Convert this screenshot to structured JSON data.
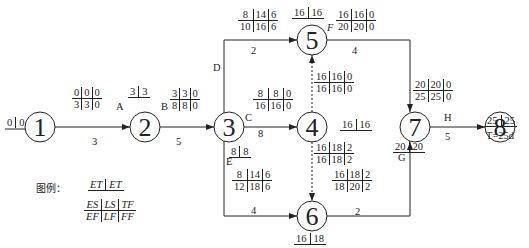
{
  "diagram": {
    "type": "double-code network diagram (activity on arrow)",
    "total_duration": "T=25d",
    "nodes": [
      {
        "id": "1",
        "et": [
          "0",
          "0"
        ],
        "cx": 40,
        "cy": 127
      },
      {
        "id": "2",
        "et": [
          "3",
          "3"
        ],
        "cx": 145,
        "cy": 127
      },
      {
        "id": "3",
        "et": [
          "3",
          "3"
        ],
        "cx": 229,
        "cy": 127
      },
      {
        "id": "4",
        "et": [
          "16",
          "16"
        ],
        "cx": 312,
        "cy": 127
      },
      {
        "id": "5",
        "et": [
          "16",
          "16"
        ],
        "cx": 312,
        "cy": 40
      },
      {
        "id": "6",
        "et": [
          "16",
          "18"
        ],
        "cx": 312,
        "cy": 216
      },
      {
        "id": "7",
        "et": [
          "20",
          "20"
        ],
        "cx": 415,
        "cy": 127
      },
      {
        "id": "8",
        "et": [
          "25",
          "25"
        ],
        "cx": 500,
        "cy": 127
      }
    ],
    "node_et_labels": {
      "n1": "0|0",
      "n2": "3|3",
      "n3": "8|8",
      "n4": "16|16",
      "n5": "16|16",
      "n6": "16|18",
      "n7": "20|20",
      "n8": "25|25"
    },
    "activities": [
      {
        "name": "A",
        "from": "1",
        "to": "2",
        "duration": "3",
        "ES": "0",
        "LS": "0",
        "TF": "0",
        "EF": "3",
        "LF": "3",
        "FF": "0"
      },
      {
        "name": "B",
        "from": "2",
        "to": "3",
        "duration": "5",
        "ES": "3",
        "LS": "3",
        "TF": "0",
        "EF": "8",
        "LF": "8",
        "FF": "0"
      },
      {
        "name": "C",
        "from": "3",
        "to": "4",
        "duration": "8",
        "ES": "8",
        "LS": "8",
        "TF": "0",
        "EF": "16",
        "LF": "16",
        "FF": "0"
      },
      {
        "name": "D",
        "from": "3",
        "to": "5",
        "duration": "2",
        "ES": "8",
        "LS": "14",
        "TF": "6",
        "EF": "10",
        "LF": "16",
        "FF": "6"
      },
      {
        "name": "E",
        "from": "3",
        "to": "6",
        "duration": "4",
        "ES": "8",
        "LS": "14",
        "TF": "6",
        "EF": "12",
        "LF": "18",
        "FF": "6"
      },
      {
        "name": "F",
        "from": "5",
        "to": "7",
        "duration": "4",
        "ES": "16",
        "LS": "16",
        "TF": "0",
        "EF": "20",
        "LF": "20",
        "FF": "0"
      },
      {
        "name": "G",
        "from": "6",
        "to": "7",
        "duration": "2",
        "ES": "16",
        "LS": "18",
        "TF": "2",
        "EF": "18",
        "LF": "20",
        "FF": "2"
      },
      {
        "name": "H",
        "from": "7",
        "to": "8",
        "duration": "5",
        "ES": "20",
        "LS": "20",
        "TF": "0",
        "EF": "25",
        "LF": "25",
        "FF": "0"
      },
      {
        "name": "dummy 4-5",
        "from": "4",
        "to": "5",
        "duration": "",
        "ES": "16",
        "LS": "16",
        "TF": "0",
        "EF": "16",
        "LF": "16",
        "FF": "0"
      },
      {
        "name": "dummy 4-6",
        "from": "4",
        "to": "6",
        "duration": "",
        "ES": "16",
        "LS": "18",
        "TF": "2",
        "EF": "16",
        "LF": "18",
        "FF": "2"
      }
    ],
    "legend": {
      "title": "图例：",
      "et_row": [
        "ET",
        "ET"
      ],
      "top_row": [
        "ES",
        "LS",
        "TF"
      ],
      "bottom_row": [
        "EF",
        "LF",
        "FF"
      ]
    }
  }
}
